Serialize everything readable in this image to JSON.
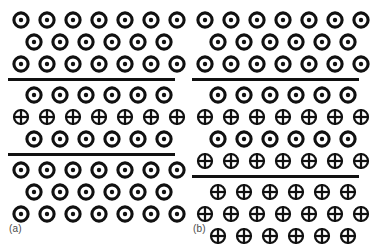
{
  "figure": {
    "colors": {
      "symbol_stroke": "#111111",
      "background": "#ffffff",
      "separator": "#111111",
      "label_text": "#4a4a4a"
    },
    "symbol_legend": {
      "dot": "circle-with-center-dot-icon",
      "cross": "circle-with-cross-icon"
    }
  },
  "panels": [
    {
      "id": "a",
      "label": "(a)",
      "regions": [
        {
          "name": "upper-domain",
          "rows": [
            {
              "symbol": "dot",
              "count": 7,
              "offset": 0
            },
            {
              "symbol": "dot",
              "count": 6,
              "offset": 1
            },
            {
              "symbol": "dot",
              "count": 7,
              "offset": 0
            }
          ]
        },
        {
          "name": "separator",
          "separator": true
        },
        {
          "name": "middle-domain",
          "rows": [
            {
              "symbol": "dot",
              "count": 6,
              "offset": 1
            },
            {
              "symbol": "cross",
              "count": 7,
              "offset": 0
            },
            {
              "symbol": "dot",
              "count": 6,
              "offset": 1
            }
          ]
        },
        {
          "name": "separator",
          "separator": true
        },
        {
          "name": "lower-domain",
          "rows": [
            {
              "symbol": "dot",
              "count": 7,
              "offset": 0
            },
            {
              "symbol": "dot",
              "count": 6,
              "offset": 1
            },
            {
              "symbol": "dot",
              "count": 7,
              "offset": 0
            }
          ]
        }
      ]
    },
    {
      "id": "b",
      "label": "(b)",
      "regions": [
        {
          "name": "upper-domain",
          "rows": [
            {
              "symbol": "dot",
              "count": 7,
              "offset": 0
            },
            {
              "symbol": "dot",
              "count": 6,
              "offset": 1
            },
            {
              "symbol": "dot",
              "count": 7,
              "offset": 0
            }
          ]
        },
        {
          "name": "separator",
          "separator": true
        },
        {
          "name": "middle-domain",
          "rows": [
            {
              "symbol": "dot",
              "count": 6,
              "offset": 1
            },
            {
              "symbol": "cross",
              "count": 7,
              "offset": 0
            },
            {
              "symbol": "dot",
              "count": 6,
              "offset": 1
            },
            {
              "symbol": "cross",
              "count": 7,
              "offset": 0
            }
          ]
        },
        {
          "name": "separator",
          "separator": true
        },
        {
          "name": "lower-domain",
          "rows": [
            {
              "symbol": "cross",
              "count": 6,
              "offset": 1
            },
            {
              "symbol": "cross",
              "count": 7,
              "offset": 0
            },
            {
              "symbol": "cross",
              "count": 6,
              "offset": 1
            }
          ]
        }
      ]
    }
  ]
}
